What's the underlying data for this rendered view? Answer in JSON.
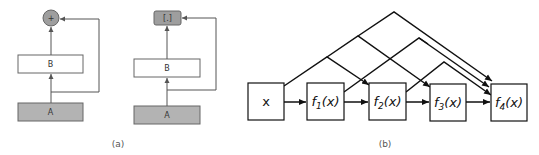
{
  "colors": {
    "gray_fill": "#b3b3b3",
    "stroke_light": "#555555",
    "stroke_dark": "#111111",
    "background": "#ffffff"
  },
  "panel_a": {
    "caption": "(a)",
    "residual_block": {
      "merge_symbol": "+",
      "upper_box": "B",
      "lower_box": "A"
    },
    "concat_block": {
      "merge_symbol": "[.]",
      "upper_box": "B",
      "lower_box": "A"
    }
  },
  "panel_b": {
    "caption": "(b)",
    "nodes": [
      {
        "label": "x",
        "func": "",
        "sub": ""
      },
      {
        "label": "",
        "func": "f",
        "sub": "1",
        "arg": "(x)"
      },
      {
        "label": "",
        "func": "f",
        "sub": "2",
        "arg": "(x)"
      },
      {
        "label": "",
        "func": "f",
        "sub": "3",
        "arg": "(x)"
      },
      {
        "label": "",
        "func": "f",
        "sub": "4",
        "arg": "(x)"
      }
    ]
  }
}
